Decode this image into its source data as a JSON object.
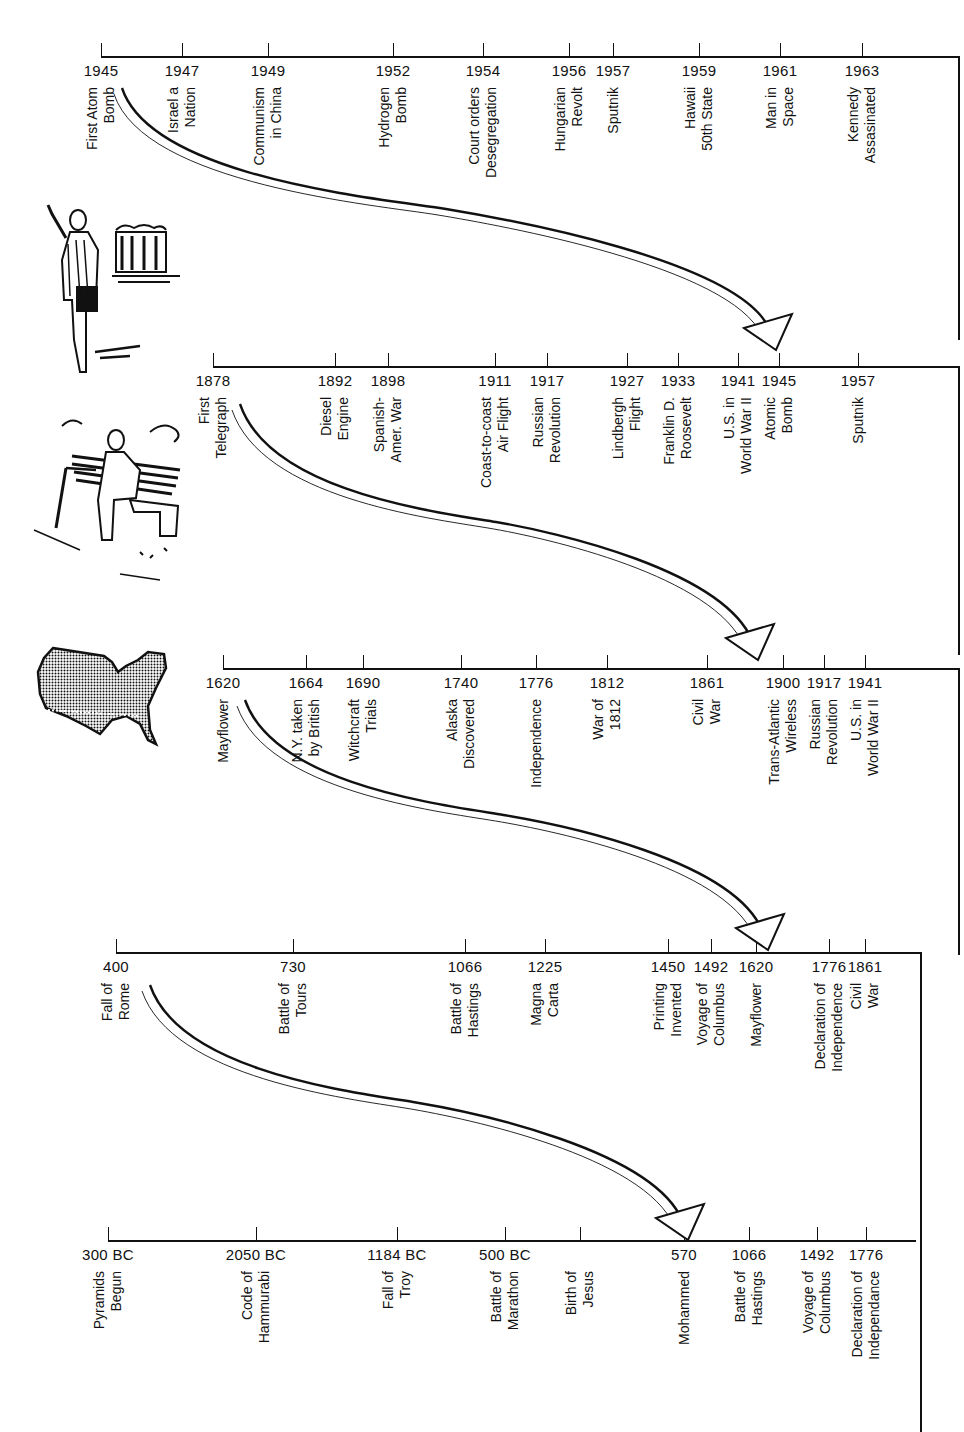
{
  "chart_data": {
    "type": "timeline",
    "title": "",
    "timelines": [
      {
        "id": "t1",
        "events": [
          {
            "year": "1945",
            "label": "First Atom\nBomb"
          },
          {
            "year": "1947",
            "label": "Israel a\nNation"
          },
          {
            "year": "1949",
            "label": "Communism\nin China"
          },
          {
            "year": "1952",
            "label": "Hydrogen\nBomb"
          },
          {
            "year": "1954",
            "label": "Court orders\nDesegregation"
          },
          {
            "year": "1956",
            "label": "Hungarian\nRevolt"
          },
          {
            "year": "1957",
            "label": "Sputnik"
          },
          {
            "year": "1959",
            "label": "Hawaii\n50th State"
          },
          {
            "year": "1961",
            "label": "Man in\nSpace"
          },
          {
            "year": "1963",
            "label": "Kennedy\nAssasinated"
          }
        ]
      },
      {
        "id": "t2",
        "events": [
          {
            "year": "1878",
            "label": "First\nTelegraph"
          },
          {
            "year": "1892",
            "label": "Diesel\nEngine"
          },
          {
            "year": "1898",
            "label": "Spanish-\nAmer. War"
          },
          {
            "year": "1911",
            "label": "Coast-to-coast\nAir Flight"
          },
          {
            "year": "1917",
            "label": "Russian\nRevolution"
          },
          {
            "year": "1927",
            "label": "Lindbergh\nFlight"
          },
          {
            "year": "1933",
            "label": "Franklin D.\nRoosevelt"
          },
          {
            "year": "1941",
            "label": "U.S. in\nWorld War II"
          },
          {
            "year": "1945",
            "label": "Atomic\nBomb"
          },
          {
            "year": "1957",
            "label": "Sputnik"
          }
        ]
      },
      {
        "id": "t3",
        "events": [
          {
            "year": "1620",
            "label": "Mayflower"
          },
          {
            "year": "1664",
            "label": "N.Y. taken\nby British"
          },
          {
            "year": "1690",
            "label": "Witchcraft\nTrials"
          },
          {
            "year": "1740",
            "label": "Alaska\nDiscovered"
          },
          {
            "year": "1776",
            "label": "Independence"
          },
          {
            "year": "1812",
            "label": "War of\n1812"
          },
          {
            "year": "1861",
            "label": "Civil\nWar"
          },
          {
            "year": "1900",
            "label": "Trans-Atlantic\nWireless"
          },
          {
            "year": "1917",
            "label": "Russian\nRevolution"
          },
          {
            "year": "1941",
            "label": "U.S. in\nWorld War II"
          }
        ]
      },
      {
        "id": "t4",
        "events": [
          {
            "year": "400",
            "label": "Fall of\nRome"
          },
          {
            "year": "730",
            "label": "Battle of\nTours"
          },
          {
            "year": "1066",
            "label": "Battle of\nHastings"
          },
          {
            "year": "1225",
            "label": "Magna\nCarta"
          },
          {
            "year": "1450",
            "label": "Printing\nInvented"
          },
          {
            "year": "1492",
            "label": "Voyage of\nColumbus"
          },
          {
            "year": "1620",
            "label": "Mayflower"
          },
          {
            "year": "1776",
            "label": "Declaration of\nIndependence"
          },
          {
            "year": "1861",
            "label": "Civil\nWar"
          }
        ]
      },
      {
        "id": "t5",
        "events": [
          {
            "year": "300 BC",
            "label": "Pyramids\nBegun"
          },
          {
            "year": "2050 BC",
            "label": "Code of\nHammurabi"
          },
          {
            "year": "1184 BC",
            "label": "Fall of\nTroy"
          },
          {
            "year": "500 BC",
            "label": "Battle of\nMarathon"
          },
          {
            "year": "",
            "label": "Birth of\nJesus"
          },
          {
            "year": "570",
            "label": "Mohammed"
          },
          {
            "year": "1066",
            "label": "Battle of\nHastings"
          },
          {
            "year": "1492",
            "label": "Voyage of\nColumbus"
          },
          {
            "year": "1776",
            "label": "Declaration of\nIndependance"
          }
        ]
      }
    ],
    "illustrations": [
      "man-with-book-and-building",
      "old-man-on-bench",
      "usa-map"
    ]
  },
  "colors": {
    "ink": "#111111",
    "paper": "#ffffff"
  }
}
